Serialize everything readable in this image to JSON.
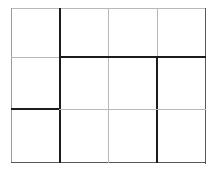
{
  "figure": {
    "kind": "grid-line-figure",
    "canvas": {
      "width": 217,
      "height": 171,
      "background": "#ffffff"
    },
    "grid": {
      "columns": 4,
      "rows": 3,
      "cells_total": 12,
      "bounds": {
        "left": 11,
        "top": 8,
        "right": 206,
        "bottom": 163
      },
      "column_x": [
        11,
        60,
        108,
        157,
        206
      ],
      "row_y": [
        8,
        57,
        109,
        163
      ]
    },
    "palette": {
      "thin_light": "#b8b8b8",
      "thin_medium": "#58585a",
      "thick_dark": "#1c1c1c",
      "background": "#ffffff"
    },
    "frame": [
      {
        "name": "frame-top-edge",
        "orientation": "horizontal",
        "x": 11,
        "y": 8,
        "length": 195,
        "thickness": 1,
        "color": "#b8b8b8",
        "weight": "thin"
      },
      {
        "name": "frame-left-edge",
        "orientation": "vertical",
        "x": 11,
        "y": 8,
        "length": 155,
        "thickness": 1,
        "color": "#9a9a9a",
        "weight": "thin"
      },
      {
        "name": "frame-right-edge",
        "orientation": "vertical",
        "x": 205,
        "y": 8,
        "length": 156,
        "thickness": 1,
        "color": "#58585a",
        "weight": "thin"
      },
      {
        "name": "frame-bottom-edge",
        "orientation": "horizontal",
        "x": 11,
        "y": 162,
        "length": 195,
        "thickness": 1,
        "color": "#58585a",
        "weight": "thin"
      }
    ],
    "interior_rules": [
      {
        "name": "vertical-rule-1-upper",
        "orientation": "vertical",
        "x": 59,
        "y": 8,
        "length": 49,
        "thickness": 2,
        "color": "#1c1c1c",
        "weight": "thick"
      },
      {
        "name": "vertical-rule-1-middle",
        "orientation": "vertical",
        "x": 59,
        "y": 57,
        "length": 52,
        "thickness": 2,
        "color": "#1c1c1c",
        "weight": "thick"
      },
      {
        "name": "vertical-rule-1-lower",
        "orientation": "vertical",
        "x": 59,
        "y": 109,
        "length": 54,
        "thickness": 2,
        "color": "#1c1c1c",
        "weight": "thick"
      },
      {
        "name": "vertical-rule-2-upper",
        "orientation": "vertical",
        "x": 108,
        "y": 8,
        "length": 49,
        "thickness": 1,
        "color": "#b8b8b8",
        "weight": "thin"
      },
      {
        "name": "vertical-rule-2-middle",
        "orientation": "vertical",
        "x": 108,
        "y": 57,
        "length": 52,
        "thickness": 1,
        "color": "#b8b8b8",
        "weight": "thin"
      },
      {
        "name": "vertical-rule-2-lower",
        "orientation": "vertical",
        "x": 108,
        "y": 109,
        "length": 54,
        "thickness": 1,
        "color": "#b8b8b8",
        "weight": "thin"
      },
      {
        "name": "vertical-rule-3-upper",
        "orientation": "vertical",
        "x": 157,
        "y": 8,
        "length": 49,
        "thickness": 1,
        "color": "#b8b8b8",
        "weight": "thin"
      },
      {
        "name": "vertical-rule-3-middle",
        "orientation": "vertical",
        "x": 156,
        "y": 57,
        "length": 52,
        "thickness": 2,
        "color": "#1c1c1c",
        "weight": "thick"
      },
      {
        "name": "vertical-rule-3-lower",
        "orientation": "vertical",
        "x": 156,
        "y": 109,
        "length": 54,
        "thickness": 2,
        "color": "#1c1c1c",
        "weight": "thick"
      },
      {
        "name": "horizontal-rule-1-left",
        "orientation": "horizontal",
        "x": 11,
        "y": 57,
        "length": 49,
        "thickness": 1,
        "color": "#b8b8b8",
        "weight": "thin"
      },
      {
        "name": "horizontal-rule-1-right",
        "orientation": "horizontal",
        "x": 59,
        "y": 56,
        "length": 147,
        "thickness": 2,
        "color": "#1c1c1c",
        "weight": "thick"
      },
      {
        "name": "horizontal-rule-2-left",
        "orientation": "horizontal",
        "x": 11,
        "y": 108,
        "length": 50,
        "thickness": 2,
        "color": "#1c1c1c",
        "weight": "thick"
      },
      {
        "name": "horizontal-rule-2-right",
        "orientation": "horizontal",
        "x": 59,
        "y": 109,
        "length": 147,
        "thickness": 1,
        "color": "#b8b8b8",
        "weight": "thin"
      }
    ]
  }
}
